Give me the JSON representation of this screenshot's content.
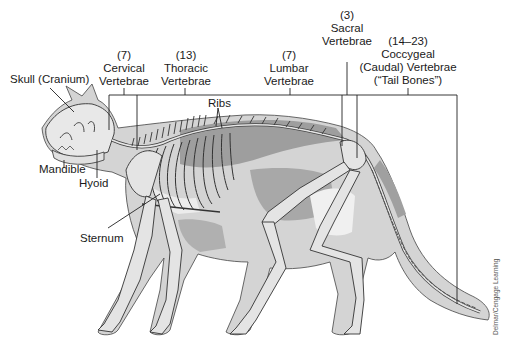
{
  "figure": {
    "colors": {
      "background": "#ffffff",
      "body_light": "#d4d4d4",
      "body_mid": "#b3b3b3",
      "body_dark": "#9a9a9a",
      "highlight": "#ececec",
      "bone_fill": "#e6e6e6",
      "outline": "#333333",
      "leader_line": "#222222"
    },
    "credit": "Delmar/Cengage Learning"
  },
  "labels": {
    "skull": {
      "line1": "Skull (Cranium)"
    },
    "cervical": {
      "count": "(7)",
      "line1": "Cervical",
      "line2": "Vertebrae"
    },
    "thoracic": {
      "count": "(13)",
      "line1": "Thoracic",
      "line2": "Vertebrae"
    },
    "ribs": {
      "line1": "Ribs"
    },
    "lumbar": {
      "count": "(7)",
      "line1": "Lumbar",
      "line2": "Vertebrae"
    },
    "sacral": {
      "count": "(3)",
      "line1": "Sacral",
      "line2": "Vertebrae"
    },
    "coccygeal": {
      "count": "(14–23)",
      "line1": "Coccygeal",
      "line2": "(Caudal) Vertebrae",
      "line3": "(“Tail Bones”)"
    },
    "mandible": {
      "line1": "Mandible"
    },
    "hyoid": {
      "line1": "Hyoid"
    },
    "sternum": {
      "line1": "Sternum"
    }
  }
}
